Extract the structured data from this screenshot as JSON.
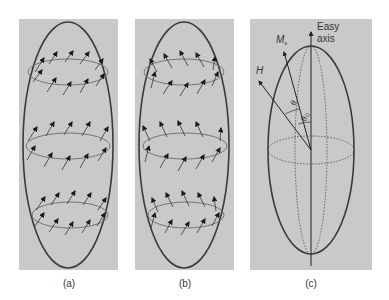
{
  "figure": {
    "panels": [
      {
        "id": "a",
        "caption": "(a)",
        "description": "Ellipsoid with three rings of magnetization arrows all tilted in the same direction (up-right)"
      },
      {
        "id": "b",
        "caption": "(b)",
        "description": "Ellipsoid with three rings of magnetization arrows; front arrows tilt up-right, back arrows tilt up-left (curling)"
      },
      {
        "id": "c",
        "caption": "(c)",
        "description": "Ellipsoid with easy axis, saturation magnetization and applied field vectors"
      }
    ],
    "labels": {
      "easy_axis_line1": "Easy",
      "easy_axis_line2": "axis",
      "ms_main": "M",
      "ms_sub": "s",
      "h": "H",
      "theta": "θ",
      "theta0": "θ",
      "theta0_sub": "0"
    },
    "colors": {
      "panel_bg": "#c9c9c9",
      "outline": "#3a3a3a",
      "ring": "#6b6b6b",
      "arrow": "#1a1a1a",
      "text": "#333333"
    }
  }
}
